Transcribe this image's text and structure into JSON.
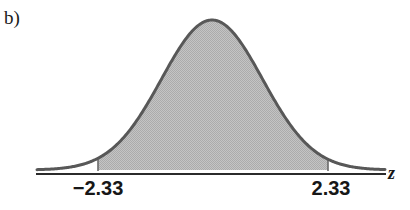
{
  "figure": {
    "part_label": "b)",
    "axis_label": "z",
    "background_color": "#ffffff"
  },
  "style": {
    "curve_stroke": "#585858",
    "curve_stroke_width": 3.0,
    "shade_fill": "#bcbcbc",
    "axis_color": "#2b2b2b",
    "axis_width": 2.0,
    "boundary_color": "#6a6a6a",
    "boundary_width": 1.6,
    "text_color": "#171717"
  },
  "geometry": {
    "baseline_y": 170,
    "axis_y": 174,
    "axis_x_start": 36,
    "axis_x_end": 386,
    "peak_x": 212,
    "peak_y": 20,
    "curve_x_start": 37,
    "curve_x_end": 385,
    "shade_left_x": 98,
    "shade_right_x": 328,
    "sigma_px": 50.5
  },
  "chart_data": {
    "type": "area",
    "title": "",
    "subtitle": "",
    "xlabel": "z",
    "ylabel": "",
    "grid": false,
    "legend": null,
    "distribution": "standard normal",
    "mean": 0,
    "standard_deviation": 1,
    "xlim": [
      -3.46,
      3.43
    ],
    "ylim": [
      0,
      0.4
    ],
    "shaded_interval": [
      -2.33,
      2.33
    ],
    "shaded_region": "central",
    "shaded_area": 0.9802,
    "tail_area_each": 0.0099,
    "tick_values": [
      -2.33,
      2.33
    ],
    "tick_labels": [
      "−2.33",
      "2.33"
    ],
    "annotations": [
      "b)"
    ],
    "curve_points": [
      {
        "z": -3.46,
        "density": 0.001
      },
      {
        "z": -3.0,
        "density": 0.0044
      },
      {
        "z": -2.5,
        "density": 0.0175
      },
      {
        "z": -2.33,
        "density": 0.0264
      },
      {
        "z": -2.0,
        "density": 0.054
      },
      {
        "z": -1.5,
        "density": 0.1295
      },
      {
        "z": -1.0,
        "density": 0.242
      },
      {
        "z": -0.5,
        "density": 0.3521
      },
      {
        "z": 0.0,
        "density": 0.3989
      },
      {
        "z": 0.5,
        "density": 0.3521
      },
      {
        "z": 1.0,
        "density": 0.242
      },
      {
        "z": 1.5,
        "density": 0.1295
      },
      {
        "z": 2.0,
        "density": 0.054
      },
      {
        "z": 2.33,
        "density": 0.0264
      },
      {
        "z": 2.5,
        "density": 0.0175
      },
      {
        "z": 3.0,
        "density": 0.0044
      },
      {
        "z": 3.43,
        "density": 0.0011
      }
    ]
  }
}
